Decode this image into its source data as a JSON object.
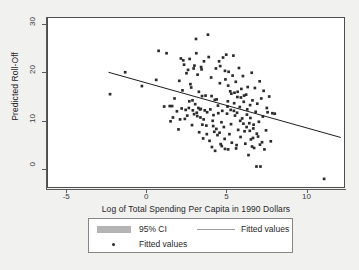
{
  "chart_data": {
    "type": "scatter",
    "title": "",
    "xlabel": "Log of Total Spending Per Capita in 1990 Dollars",
    "ylabel": "Predicted Roll-Off",
    "xlim": [
      -6.2,
      12.4
    ],
    "ylim": [
      -4.0,
      31.5
    ],
    "xticks": [
      -5,
      0,
      5,
      10
    ],
    "xticklabels": [
      "-5",
      "0",
      "5",
      "10"
    ],
    "yticks": [
      0,
      10,
      20,
      30
    ],
    "yticklabels": [
      "0",
      "10",
      "20",
      "30"
    ],
    "grid": false,
    "legend_position": "below-axes",
    "legend": [
      {
        "label": "95% CI",
        "marker": "band",
        "color": "#b4b4b4"
      },
      {
        "label": "Fitted values",
        "marker": "line",
        "color": "#a0a0a0"
      },
      {
        "label": "Fitted values",
        "marker": "dot",
        "color": "#2b2b2b"
      }
    ],
    "series": [
      {
        "name": "Fitted values",
        "type": "scatter",
        "marker": "square",
        "color": "#2b2b2b",
        "points": [
          [
            -2.3,
            15.5
          ],
          [
            -1.35,
            20.1
          ],
          [
            -0.3,
            17.2
          ],
          [
            0.6,
            18.5
          ],
          [
            0.75,
            24.6
          ],
          [
            1.1,
            12.9
          ],
          [
            1.25,
            24.1
          ],
          [
            1.45,
            13.0
          ],
          [
            1.5,
            9.8
          ],
          [
            1.6,
            13.0
          ],
          [
            1.65,
            10.6
          ],
          [
            1.75,
            14.6
          ],
          [
            1.9,
            11.9
          ],
          [
            2.0,
            8.1
          ],
          [
            2.1,
            10.2
          ],
          [
            2.2,
            12.5
          ],
          [
            2.25,
            16.3
          ],
          [
            2.3,
            22.6
          ],
          [
            2.35,
            21.7
          ],
          [
            2.4,
            10.3
          ],
          [
            2.45,
            12.2
          ],
          [
            2.5,
            19.9
          ],
          [
            2.55,
            11.0
          ],
          [
            2.6,
            20.6
          ],
          [
            2.65,
            12.6
          ],
          [
            2.7,
            22.9
          ],
          [
            2.75,
            17.6
          ],
          [
            2.8,
            16.9
          ],
          [
            2.85,
            9.0
          ],
          [
            2.9,
            12.1
          ],
          [
            2.95,
            20.9
          ],
          [
            3.0,
            21.5
          ],
          [
            3.05,
            13.4
          ],
          [
            3.1,
            27.1
          ],
          [
            3.15,
            11.6
          ],
          [
            3.2,
            19.6
          ],
          [
            3.25,
            12.6
          ],
          [
            3.3,
            7.5
          ],
          [
            3.35,
            12.3
          ],
          [
            3.4,
            12.4
          ],
          [
            3.45,
            20.7
          ],
          [
            3.5,
            9.1
          ],
          [
            3.55,
            6.2
          ],
          [
            3.6,
            22.4
          ],
          [
            3.65,
            12.1
          ],
          [
            3.7,
            15.2
          ],
          [
            3.75,
            8.9
          ],
          [
            3.8,
            11.7
          ],
          [
            3.85,
            28.0
          ],
          [
            3.9,
            23.3
          ],
          [
            3.95,
            5.7
          ],
          [
            4.0,
            12.3
          ],
          [
            4.05,
            19.0
          ],
          [
            4.1,
            4.4
          ],
          [
            4.15,
            9.9
          ],
          [
            4.2,
            11.1
          ],
          [
            4.25,
            7.6
          ],
          [
            4.3,
            3.6
          ],
          [
            4.35,
            20.9
          ],
          [
            4.4,
            14.4
          ],
          [
            4.45,
            6.9
          ],
          [
            4.5,
            11.5
          ],
          [
            4.55,
            22.4
          ],
          [
            4.6,
            17.8
          ],
          [
            4.65,
            5.0
          ],
          [
            4.7,
            9.6
          ],
          [
            4.75,
            12.0
          ],
          [
            4.8,
            23.2
          ],
          [
            4.85,
            8.6
          ],
          [
            4.9,
            6.1
          ],
          [
            4.95,
            18.6
          ],
          [
            5.0,
            23.8
          ],
          [
            5.05,
            11.4
          ],
          [
            5.1,
            14.0
          ],
          [
            5.15,
            20.2
          ],
          [
            5.2,
            7.1
          ],
          [
            5.25,
            16.1
          ],
          [
            5.3,
            9.2
          ],
          [
            5.35,
            5.3
          ],
          [
            5.4,
            19.4
          ],
          [
            5.45,
            23.6
          ],
          [
            5.5,
            13.6
          ],
          [
            5.55,
            11.0
          ],
          [
            5.6,
            18.1
          ],
          [
            5.65,
            4.8
          ],
          [
            5.7,
            14.9
          ],
          [
            5.75,
            8.0
          ],
          [
            5.8,
            21.0
          ],
          [
            5.85,
            12.8
          ],
          [
            5.9,
            6.5
          ],
          [
            5.95,
            16.6
          ],
          [
            6.0,
            10.4
          ],
          [
            6.05,
            19.3
          ],
          [
            6.1,
            13.9
          ],
          [
            6.15,
            7.7
          ],
          [
            6.2,
            5.1
          ],
          [
            6.25,
            15.4
          ],
          [
            6.3,
            11.2
          ],
          [
            6.35,
            17.0
          ],
          [
            6.4,
            2.7
          ],
          [
            6.45,
            9.4
          ],
          [
            6.5,
            13.2
          ],
          [
            6.55,
            6.0
          ],
          [
            6.6,
            20.0
          ],
          [
            6.65,
            14.2
          ],
          [
            6.7,
            8.3
          ],
          [
            6.75,
            4.2
          ],
          [
            6.8,
            16.8
          ],
          [
            6.85,
            11.8
          ],
          [
            6.9,
            0.3
          ],
          [
            6.95,
            13.5
          ],
          [
            7.0,
            6.6
          ],
          [
            7.05,
            9.7
          ],
          [
            7.1,
            18.2
          ],
          [
            7.15,
            0.3
          ],
          [
            7.2,
            14.6
          ],
          [
            7.25,
            5.4
          ],
          [
            7.3,
            10.8
          ],
          [
            7.35,
            16.2
          ],
          [
            7.4,
            3.9
          ],
          [
            7.5,
            7.9
          ],
          [
            7.55,
            12.6
          ],
          [
            7.6,
            11.7
          ],
          [
            7.7,
            15.0
          ],
          [
            7.8,
            5.6
          ],
          [
            7.9,
            11.5
          ],
          [
            8.05,
            11.4
          ],
          [
            11.15,
            -2.3
          ],
          [
            2.05,
            18.3
          ],
          [
            2.15,
            23.0
          ],
          [
            3.12,
            24.1
          ],
          [
            3.42,
            21.2
          ],
          [
            4.62,
            21.4
          ],
          [
            4.92,
            20.4
          ],
          [
            5.12,
            17.3
          ],
          [
            5.32,
            15.6
          ],
          [
            5.52,
            15.8
          ],
          [
            5.72,
            16.0
          ],
          [
            5.92,
            14.8
          ],
          [
            6.12,
            15.2
          ],
          [
            6.32,
            12.3
          ],
          [
            6.52,
            10.5
          ],
          [
            6.72,
            9.1
          ],
          [
            6.92,
            7.2
          ],
          [
            4.08,
            15.1
          ],
          [
            4.28,
            14.3
          ],
          [
            4.48,
            13.1
          ],
          [
            3.28,
            16.0
          ],
          [
            3.48,
            15.1
          ],
          [
            2.88,
            14.2
          ],
          [
            2.68,
            14.0
          ],
          [
            5.08,
            12.9
          ],
          [
            5.28,
            12.2
          ],
          [
            5.48,
            12.0
          ],
          [
            5.68,
            11.6
          ],
          [
            5.88,
            9.9
          ],
          [
            4.18,
            8.8
          ],
          [
            4.38,
            8.2
          ],
          [
            4.58,
            7.4
          ],
          [
            3.78,
            7.1
          ],
          [
            3.58,
            10.2
          ],
          [
            3.38,
            10.6
          ],
          [
            3.18,
            10.9
          ],
          [
            2.98,
            11.3
          ],
          [
            6.08,
            9.3
          ],
          [
            6.28,
            8.6
          ],
          [
            6.48,
            7.8
          ],
          [
            6.68,
            6.3
          ],
          [
            4.72,
            4.6
          ],
          [
            4.92,
            4.0
          ],
          [
            5.12,
            3.9
          ],
          [
            5.62,
            4.1
          ],
          [
            6.62,
            4.5
          ],
          [
            7.12,
            4.9
          ]
        ]
      }
    ],
    "fit_line": {
      "name": "Fitted values",
      "color": "#1a1a1a",
      "x_start": -2.4,
      "y_start": 20.1,
      "x_end": 12.2,
      "y_end": 6.4
    }
  },
  "axes": {
    "y_title": "Predicted Roll-Off",
    "x_title": "Log of Total Spending Per Capita in 1990 Dollars",
    "y_tick_labels": [
      "30",
      "20",
      "10",
      "0"
    ],
    "x_tick_labels": [
      "-5",
      "0",
      "5",
      "10"
    ]
  },
  "legend": {
    "ci_label": "95% CI",
    "fitted_line_label": "Fitted values",
    "fitted_points_label": "Fitted values"
  }
}
